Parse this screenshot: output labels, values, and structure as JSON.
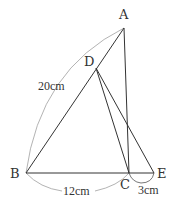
{
  "figure": {
    "type": "geometry",
    "points": {
      "A": {
        "label": "A",
        "x": 124,
        "y": 28
      },
      "B": {
        "label": "B",
        "x": 26,
        "y": 173
      },
      "C": {
        "label": "C",
        "x": 129,
        "y": 173
      },
      "D": {
        "label": "D",
        "x": 96,
        "y": 68
      },
      "E": {
        "label": "E",
        "x": 154,
        "y": 173
      }
    },
    "segments": [
      "AB",
      "AC",
      "BE",
      "DC",
      "DE"
    ],
    "measurements": {
      "AB": "20cm",
      "BC": "12cm",
      "CE": "3cm"
    },
    "stroke_color": "#333333",
    "arc_color": "#999999"
  }
}
